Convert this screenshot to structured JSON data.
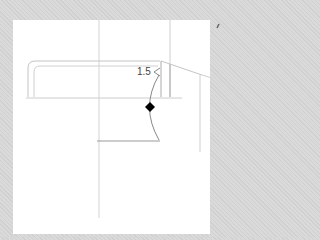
{
  "drawing": {
    "dimension_label": "1.5",
    "colors": {
      "background": "#d6d6d6",
      "sheet": "#ffffff",
      "line": "#b8b8b8",
      "dark_line": "#888888",
      "marker": "#000000"
    }
  }
}
